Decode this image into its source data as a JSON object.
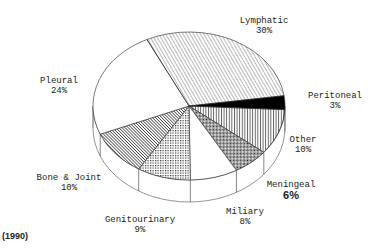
{
  "chart_data": {
    "type": "pie",
    "title": "",
    "note": "(1990)",
    "style": "3d-tilted",
    "slices": [
      {
        "label": "Peritoneal",
        "value": 3,
        "pct_label": "3%",
        "pattern": "solid-black"
      },
      {
        "label": "Other",
        "value": 10,
        "pct_label": "10%",
        "pattern": "vertical-lines"
      },
      {
        "label": "Meningeal",
        "value": 6,
        "pct_label": "6%",
        "pattern": "crosshatch-dense"
      },
      {
        "label": "Miliary",
        "value": 8,
        "pct_label": "8%",
        "pattern": "white"
      },
      {
        "label": "Genitourinary",
        "value": 9,
        "pct_label": "9%",
        "pattern": "dots"
      },
      {
        "label": "Bone & Joint",
        "value": 10,
        "pct_label": "10%",
        "pattern": "diagonal-dense"
      },
      {
        "label": "Pleural",
        "value": 24,
        "pct_label": "24%",
        "pattern": "white"
      },
      {
        "label": "Lymphatic",
        "value": 30,
        "pct_label": "30%",
        "pattern": "diagonal-light"
      }
    ],
    "start_angle_deg": -8,
    "total": 100
  },
  "labels": {
    "lymphatic": {
      "name": "Lymphatic",
      "pct": "30%"
    },
    "peritoneal": {
      "name": "Peritoneal",
      "pct": "3%"
    },
    "other": {
      "name": "Other",
      "pct": "10%"
    },
    "meningeal": {
      "name": "Meningeal",
      "pct": "6%"
    },
    "miliary": {
      "name": "Miliary",
      "pct": "8%"
    },
    "genitourinary": {
      "name": "Genitourinary",
      "pct": "9%"
    },
    "bone_joint": {
      "name": "Bone & Joint",
      "pct": "10%"
    },
    "pleural": {
      "name": "Pleural",
      "pct": "24%"
    }
  },
  "year": "(1990)"
}
